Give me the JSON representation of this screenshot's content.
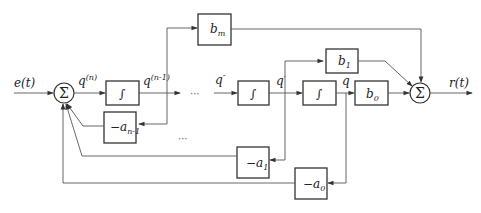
{
  "diagram": {
    "type": "block-diagram",
    "input_label": "e(t)",
    "output_label": "r(t)",
    "summers": [
      {
        "id": "sum-in",
        "symbol": "Σ"
      },
      {
        "id": "sum-out",
        "symbol": "Σ"
      }
    ],
    "signals": {
      "q_n": {
        "base": "q",
        "sup": "(n)"
      },
      "q_n1": {
        "base": "q",
        "sup": "(n-1)"
      },
      "q_2": {
        "base": "q",
        "sup": "″"
      },
      "q_1": {
        "base": "q",
        "sup": "′"
      },
      "q_0": {
        "base": "q",
        "sup": ""
      }
    },
    "integrators": [
      {
        "id": "int-1",
        "symbol": "∫"
      },
      {
        "id": "int-2",
        "symbol": "∫"
      },
      {
        "id": "int-3",
        "symbol": "∫"
      }
    ],
    "forward_gains": [
      {
        "id": "bm",
        "base": "b",
        "sub": "m"
      },
      {
        "id": "b1",
        "base": "b",
        "sub": "1"
      },
      {
        "id": "b0",
        "base": "b",
        "sub": "0"
      }
    ],
    "feedback_gains": [
      {
        "id": "an1",
        "prefix": "−a",
        "sub": "n-1"
      },
      {
        "id": "a1",
        "prefix": "−a",
        "sub": "1"
      },
      {
        "id": "a0",
        "prefix": "−a",
        "sub": "0"
      }
    ],
    "ellipses": [
      "···",
      "···"
    ]
  }
}
